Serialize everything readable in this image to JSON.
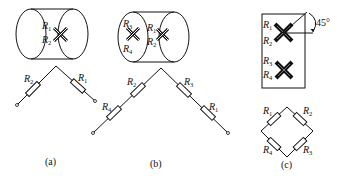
{
  "figure": {
    "panels": [
      {
        "id": "a",
        "caption": "(a)",
        "gauge_labels": [
          "R1",
          "R2"
        ],
        "circuit": "half-bridge: R2 (left arm), R1 (right arm)"
      },
      {
        "id": "b",
        "caption": "(b)",
        "gauge_labels": [
          "R3",
          "R4",
          "R1",
          "R2"
        ],
        "circuit": "series arms: left R4-R2, right R3-R1"
      },
      {
        "id": "c",
        "caption": "(c)",
        "gauge_labels": [
          "R1",
          "R2",
          "R3",
          "R4"
        ],
        "angle_label": "45°",
        "circuit": "full bridge: R1 top-left, R2 top-right, R4 bottom-left, R3 bottom-right"
      }
    ],
    "labels": {
      "a_R1": "R",
      "a_R1_sub": "1",
      "a_R2": "R",
      "a_R2_sub": "2",
      "a_cR2": "R",
      "a_cR2_sub": "2",
      "a_cR1": "R",
      "a_cR1_sub": "1",
      "b_R3": "R",
      "b_R3_sub": "3",
      "b_R4": "R",
      "b_R4_sub": "4",
      "b_R1": "R",
      "b_R1_sub": "1",
      "b_R2": "R",
      "b_R2_sub": "2",
      "b_cR2": "R",
      "b_cR2_sub": "2",
      "b_cR4": "R",
      "b_cR4_sub": "4",
      "b_cR3": "R",
      "b_cR3_sub": "3",
      "b_cR1": "R",
      "b_cR1_sub": "1",
      "c_R1": "R",
      "c_R1_sub": "1",
      "c_R2": "R",
      "c_R2_sub": "2",
      "c_R3": "R",
      "c_R3_sub": "3",
      "c_R4": "R",
      "c_R4_sub": "4",
      "c_angle": "45°",
      "c_bR1": "R",
      "c_bR1_sub": "1",
      "c_bR2": "R",
      "c_bR2_sub": "2",
      "c_bR4": "R",
      "c_bR4_sub": "4",
      "c_bR3": "R",
      "c_bR3_sub": "3",
      "cap_a": "(a)",
      "cap_b": "(b)",
      "cap_c": "(c)"
    }
  }
}
